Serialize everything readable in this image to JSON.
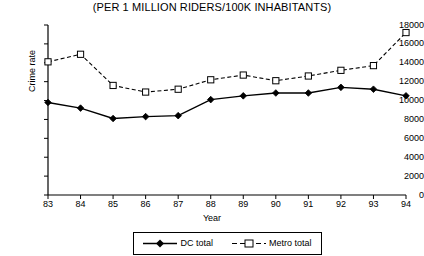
{
  "chart_data": {
    "type": "line",
    "title": "(PER 1 MILLION RIDERS/100K INHABITANTS)",
    "xlabel": "Year",
    "ylabel": "Crime rate",
    "categories": [
      "83",
      "84",
      "85",
      "86",
      "87",
      "88",
      "89",
      "90",
      "91",
      "92",
      "93",
      "94"
    ],
    "x_tick_labels": [
      "83",
      "84",
      "85",
      "86",
      "87",
      "88",
      "89",
      "90",
      "91",
      "92",
      "93",
      "94"
    ],
    "y_tick_labels": [
      "0",
      "2000",
      "4000",
      "6000",
      "8000",
      "10000",
      "12000",
      "14000",
      "16000",
      "18000"
    ],
    "y_ticks": [
      0,
      2000,
      4000,
      6000,
      8000,
      10000,
      12000,
      14000,
      16000,
      18000
    ],
    "ylim": [
      0,
      18000
    ],
    "grid": false,
    "legend_position": "bottom",
    "series": [
      {
        "name": "DC total",
        "marker": "filled-diamond",
        "line_style": "solid",
        "color": "#000000",
        "values": [
          9800,
          9200,
          8100,
          8300,
          8400,
          10100,
          10500,
          10800,
          10800,
          11400,
          11200,
          10500
        ]
      },
      {
        "name": "Metro total",
        "marker": "open-square",
        "line_style": "dashed",
        "color": "#000000",
        "values": [
          14100,
          14900,
          11600,
          10900,
          11200,
          12200,
          12700,
          12100,
          12600,
          13200,
          13700,
          17200
        ]
      }
    ]
  },
  "legend": {
    "items": [
      {
        "label": "DC total"
      },
      {
        "label": "Metro total"
      }
    ]
  }
}
